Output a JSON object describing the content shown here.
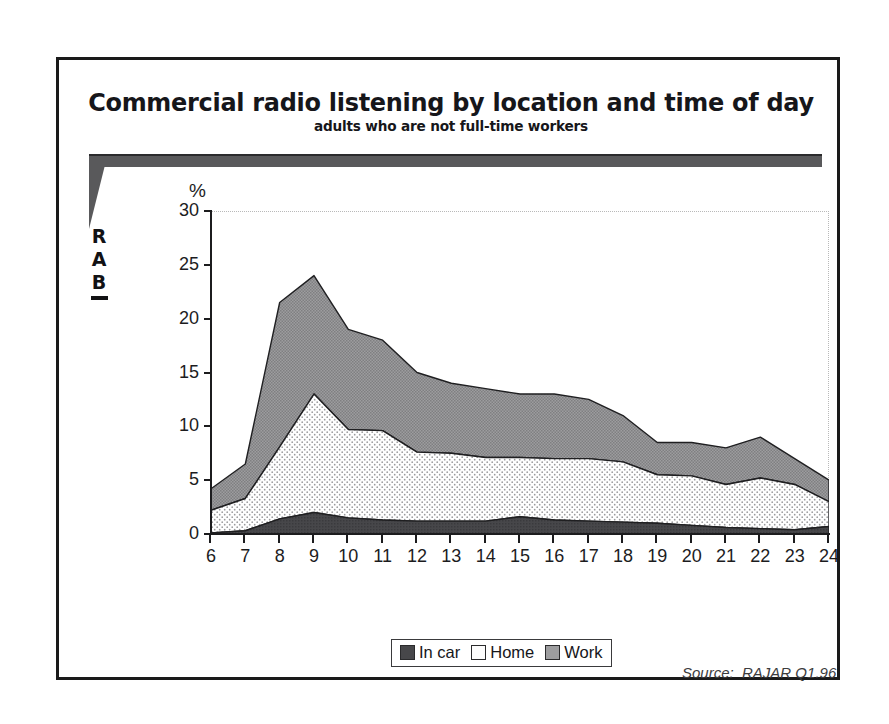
{
  "header": {
    "title": "Commercial radio listening by location and time of day",
    "subtitle": "adults who are not full-time workers"
  },
  "logo": {
    "name": "rab-logo",
    "letters": "R\nA\nB"
  },
  "source": {
    "text": "Source:  RAJAR Q1.96"
  },
  "axis": {
    "y_unit_label": "%"
  },
  "legend": {
    "items": [
      {
        "label": "In car",
        "color": "#4a4a4c",
        "pattern": "solid-dark"
      },
      {
        "label": "Home",
        "color": "#fbfbfb",
        "pattern": "dotted-light"
      },
      {
        "label": "Work",
        "color": "#919193",
        "pattern": "solid-mid"
      }
    ]
  },
  "colors": {
    "in_car": "#4a4a4c",
    "home": "#fbfbfb",
    "work": "#919193",
    "axis": "#1c1c1e",
    "frame": "#1a1a1a",
    "logo_bar": "#59595b"
  },
  "chart_data": {
    "type": "area",
    "stacked": true,
    "title": "Commercial radio listening by location and time of day",
    "subtitle": "adults who are not full-time workers",
    "xlabel": "",
    "ylabel": "%",
    "xlim": [
      6,
      24
    ],
    "ylim": [
      0,
      30
    ],
    "yticks": [
      0,
      5,
      10,
      15,
      20,
      25,
      30
    ],
    "ytick_labels": [
      "0",
      "5",
      "10",
      "15",
      "20",
      "25",
      "30"
    ],
    "grid": false,
    "legend_position": "bottom-center",
    "x": [
      6,
      7,
      8,
      9,
      10,
      11,
      12,
      13,
      14,
      15,
      16,
      17,
      18,
      19,
      20,
      21,
      22,
      23,
      24
    ],
    "xtick_labels": [
      "6",
      "7",
      "8",
      "9",
      "10",
      "11",
      "12",
      "13",
      "14",
      "15",
      "16",
      "17",
      "18",
      "19",
      "20",
      "21",
      "22",
      "23",
      "24"
    ],
    "series": [
      {
        "name": "In car",
        "color": "#4a4a4c",
        "values": [
          0.1,
          0.3,
          1.4,
          2.0,
          1.5,
          1.3,
          1.2,
          1.2,
          1.2,
          1.6,
          1.3,
          1.2,
          1.1,
          1.0,
          0.8,
          0.6,
          0.5,
          0.4,
          0.7
        ]
      },
      {
        "name": "Home",
        "color": "#fbfbfb",
        "values": [
          2.1,
          3.0,
          6.7,
          11.0,
          8.2,
          8.3,
          6.4,
          6.3,
          5.9,
          5.5,
          5.7,
          5.8,
          5.6,
          4.5,
          4.6,
          4.0,
          4.7,
          4.2,
          2.3
        ]
      },
      {
        "name": "Work",
        "color": "#919193",
        "values": [
          2.0,
          3.2,
          13.4,
          11.0,
          9.3,
          8.4,
          7.4,
          6.5,
          6.4,
          5.9,
          6.0,
          5.5,
          4.3,
          3.0,
          3.1,
          3.4,
          3.8,
          2.4,
          2.0
        ]
      }
    ],
    "totals": [
      4.2,
      6.5,
      21.5,
      24.0,
      19.0,
      18.0,
      15.0,
      14.0,
      13.5,
      13.0,
      13.0,
      12.5,
      11.0,
      8.5,
      8.5,
      8.0,
      9.0,
      7.0,
      5.0
    ],
    "cumulative": {
      "in_car_top": [
        0.1,
        0.3,
        1.4,
        2.0,
        1.5,
        1.3,
        1.2,
        1.2,
        1.2,
        1.6,
        1.3,
        1.2,
        1.1,
        1.0,
        0.8,
        0.6,
        0.5,
        0.4,
        0.7
      ],
      "home_top": [
        2.2,
        3.3,
        8.1,
        13.0,
        9.7,
        9.6,
        7.6,
        7.5,
        7.1,
        7.1,
        7.0,
        7.0,
        6.7,
        5.5,
        5.4,
        4.6,
        5.2,
        4.6,
        3.0
      ],
      "work_top": [
        4.2,
        6.5,
        21.5,
        24.0,
        19.0,
        18.0,
        15.0,
        14.0,
        13.5,
        13.0,
        13.0,
        12.5,
        11.0,
        8.5,
        8.5,
        8.0,
        9.0,
        7.0,
        5.0
      ]
    }
  }
}
